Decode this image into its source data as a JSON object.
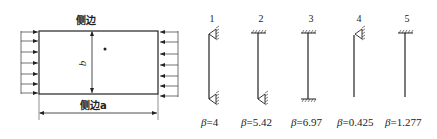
{
  "plate": {
    "top_label": "侧边",
    "bottom_label": "侧边a",
    "dimension_label": "b",
    "arrows_per_side": 7
  },
  "cases": [
    {
      "number": "1",
      "beta_symbol": "β",
      "beta_value": "=4",
      "top_support": "pin",
      "bottom_support": "pin"
    },
    {
      "number": "2",
      "beta_symbol": "β",
      "beta_value": "=5.42",
      "top_support": "fixed",
      "bottom_support": "pin"
    },
    {
      "number": "3",
      "beta_symbol": "β",
      "beta_value": "=6.97",
      "top_support": "fixed",
      "bottom_support": "fixed"
    },
    {
      "number": "4",
      "beta_symbol": "β",
      "beta_value": "=0.425",
      "top_support": "pin",
      "bottom_support": "free"
    },
    {
      "number": "5",
      "beta_symbol": "β",
      "beta_value": "=1.277",
      "top_support": "fixed",
      "bottom_support": "free"
    }
  ]
}
